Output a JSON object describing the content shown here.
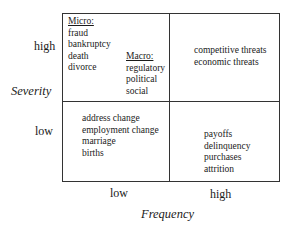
{
  "axes": {
    "y_title": "Severity",
    "x_title": "Frequency",
    "y_ticks": [
      "high",
      "low"
    ],
    "x_ticks": [
      "low",
      "high"
    ]
  },
  "quadrants": {
    "high_low_micro": {
      "header": "Micro:",
      "items": [
        "fraud",
        "bankruptcy",
        "death",
        "divorce"
      ]
    },
    "high_low_macro": {
      "header": "Macro:",
      "items": [
        "regulatory",
        "political",
        "social"
      ]
    },
    "high_high": {
      "items": [
        "competitive threats",
        "economic threats"
      ]
    },
    "low_low": {
      "items": [
        "address change",
        "employment change",
        "marriage",
        "births"
      ]
    },
    "low_high": {
      "items": [
        "payoffs",
        "delinquency",
        "purchases",
        "attrition"
      ]
    }
  }
}
